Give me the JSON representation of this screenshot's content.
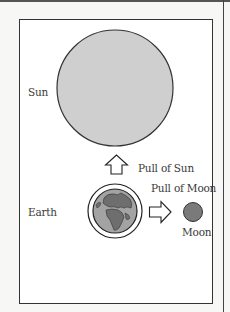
{
  "diagram": {
    "title": "",
    "labels": {
      "sun": "Sun",
      "earth": "Earth",
      "moon": "Moon",
      "pull_of_sun": "Pull of Sun",
      "pull_of_moon": "Pull of Moon"
    },
    "icons": {
      "sun": "large-grey-circle",
      "earth": "globe-icon",
      "moon": "small-dark-circle",
      "pull_sun_arrow": "arrow-up-outline-icon",
      "pull_moon_arrow": "arrow-right-outline-icon"
    },
    "colors": {
      "sun_fill": "#cfcfcf",
      "sun_stroke": "#333333",
      "moon_fill": "#7a7a7a",
      "earth_ocean": "#9a9a9a",
      "earth_land": "#6e6e6e",
      "frame_stroke": "#333333"
    }
  }
}
